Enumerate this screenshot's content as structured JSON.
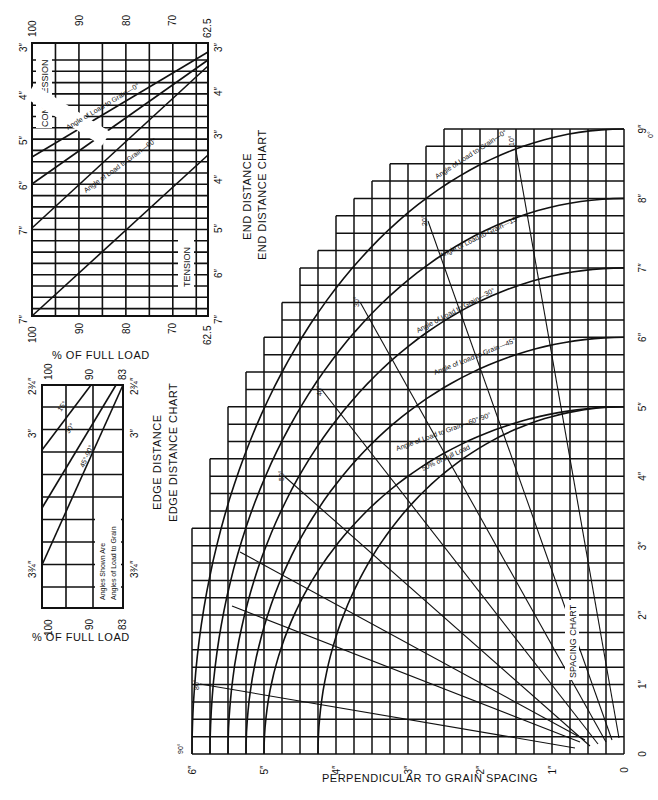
{
  "chart_data": [
    {
      "type": "line",
      "name": "end-distance-chart",
      "title": "END DISTANCE CHART",
      "subtitle": "END DISTANCE",
      "xlabel": "% OF FULL LOAD",
      "x_ticks": [
        "100",
        "90",
        "80",
        "70",
        "62.5"
      ],
      "xlim": [
        100,
        62.5
      ],
      "y_left_ticks": [
        "3″",
        "4″",
        "5″",
        "6″",
        "7″",
        "7″"
      ],
      "y_right_ticks_compression": [
        "3″",
        "4″"
      ],
      "y_right_ticks_tension": [
        "3″",
        "4″",
        "5″",
        "6″",
        "7″"
      ],
      "regions": [
        "COMPRESSION",
        "TENSION"
      ],
      "series": [
        {
          "name": "Angle of Load to Grain—0°",
          "region": "compression",
          "x": [
            100,
            62.5
          ],
          "y_in": [
            5.5,
            3.0
          ]
        },
        {
          "name": "Angle of Load to Grain (intermediate)",
          "region": "compression",
          "x": [
            100,
            62.5
          ],
          "y_in": [
            6.1,
            3.25
          ]
        },
        {
          "name": "Angle of Load to Grain—90°",
          "region": "compression",
          "x": [
            100,
            62.5
          ],
          "y_in": [
            7.0,
            3.5
          ]
        },
        {
          "name": "Tension",
          "region": "tension",
          "x": [
            100,
            62.5
          ],
          "y_in": [
            7.0,
            3.5
          ]
        }
      ]
    },
    {
      "type": "line",
      "name": "edge-distance-chart",
      "title": "EDGE DISTANCE CHART",
      "subtitle": "EDGE DISTANCE",
      "xlabel": "% OF FULL LOAD",
      "x_ticks": [
        "100",
        "90",
        "83"
      ],
      "xlim": [
        100,
        83
      ],
      "y_ticks": [
        "2¾″",
        "3″",
        "3¾″"
      ],
      "note": [
        "Angles Shown Are",
        "Angles of Load to Grain"
      ],
      "series": [
        {
          "name": "15°",
          "x": [
            100,
            89
          ],
          "y_in": [
            3.1,
            2.75
          ]
        },
        {
          "name": "30°",
          "x": [
            100,
            86
          ],
          "y_in": [
            3.4,
            2.75
          ]
        },
        {
          "name": "45°-90°",
          "x": [
            100,
            83
          ],
          "y_in": [
            3.75,
            2.75
          ]
        }
      ]
    },
    {
      "type": "line",
      "name": "spacing-chart",
      "title": "SPACING CHART",
      "xlabel": "PERPENDICULAR TO GRAIN SPACING",
      "x_ticks": [
        "6″",
        "5″",
        "4″",
        "3″",
        "2″",
        "1″",
        "0"
      ],
      "y_ticks": [
        "0",
        "1″",
        "2″",
        "3″",
        "4″",
        "5″",
        "6″",
        "7″",
        "8″",
        "9″"
      ],
      "xlim": [
        6,
        0
      ],
      "ylim": [
        0,
        9
      ],
      "grid": true,
      "series": [
        {
          "name": "Angle of Load to Grain—0°",
          "parallel_at_zero_perp": 9,
          "perp_at_zero_parallel": 6
        },
        {
          "name": "Angle of Load to Grain—15°",
          "parallel_at_zero_perp": 8,
          "perp_at_zero_parallel": 5.75
        },
        {
          "name": "Angle of Load to Grain—30°",
          "parallel_at_zero_perp": 7,
          "perp_at_zero_parallel": 5.5
        },
        {
          "name": "Angle of Load to Grain—45°",
          "parallel_at_zero_perp": 6,
          "perp_at_zero_parallel": 5.25
        },
        {
          "name": "Angle of Load to Grain—60°-90°",
          "parallel_at_zero_perp": 5,
          "perp_at_zero_parallel": 5
        },
        {
          "name": "50% of Full Load",
          "parallel_at_zero_perp": 5,
          "perp_at_zero_parallel": 4.25
        }
      ],
      "angle_rays": [
        "0°",
        "10°",
        "20°",
        "30°",
        "40°",
        "50°",
        "60°",
        "70°",
        "80°",
        "90°"
      ]
    }
  ],
  "end_chart": {
    "title": "END DISTANCE CHART",
    "subtitle": "END DISTANCE",
    "xlabel": "% OF FULL LOAD",
    "x_ticks": [
      "100",
      "90",
      "80",
      "70",
      "62.5"
    ],
    "left_ticks": [
      "3″",
      "4″",
      "5″",
      "6″",
      "7″",
      "7″"
    ],
    "right_ticks_top": [
      "3″",
      "4″"
    ],
    "right_ticks_bottom": [
      "3″",
      "4″",
      "5″",
      "6″",
      "7″"
    ],
    "compression": "COMPRESSION",
    "tension": "TENSION",
    "line0": "Angle of Load to Grain—0°",
    "line90": "Angle of Load to Grain—90°"
  },
  "edge_chart": {
    "title": "EDGE DISTANCE CHART",
    "subtitle": "EDGE DISTANCE",
    "xlabel": "% OF FULL LOAD",
    "top_ticks": [
      "100",
      "90",
      "83"
    ],
    "bottom_ticks": [
      "100",
      "90",
      "83"
    ],
    "left_ticks": [
      "2¾″",
      "3″",
      "3¾″"
    ],
    "right_ticks": [
      "2¾″",
      "3″",
      "3¾″"
    ],
    "l15": "15°",
    "l30": "30°",
    "l45": "45°-90°",
    "note1": "Angles Shown Are",
    "note2": "Angles of Load to Grain"
  },
  "spacing_chart": {
    "title": "SPACING CHART",
    "xlabel": "PERPENDICULAR TO GRAIN SPACING",
    "x_ticks": [
      "6″",
      "5″",
      "4″",
      "3″",
      "2″",
      "1″",
      "0"
    ],
    "y_ticks": [
      "0",
      "1″",
      "2″",
      "3″",
      "4″",
      "5″",
      "6″",
      "7″",
      "8″",
      "9″"
    ],
    "curve_labels": [
      "Angle of Load to Grain—0°",
      "Angle of Load to Grain—15°",
      "Angle of Load to Grain—30°",
      "Angle of Load to Grain—45°",
      "Angle of Load to Grain—60°-90°",
      "50% of Full Load"
    ],
    "angle_labels": {
      "a0": "0°",
      "a10": "10°",
      "a20": "20°",
      "a30": "30°",
      "a40": "40°",
      "a50": "50°",
      "a80": "80°",
      "a90": "90°"
    }
  }
}
